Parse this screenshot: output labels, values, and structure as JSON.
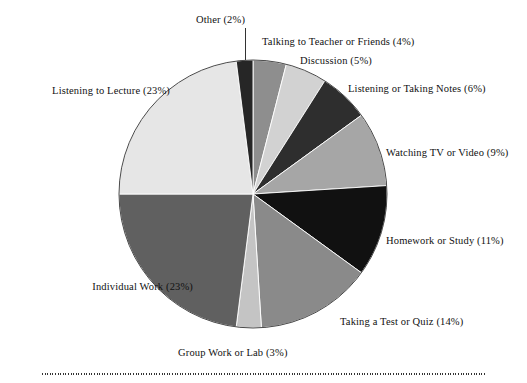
{
  "figure": {
    "title": "",
    "has_bottom_rule": true,
    "background": "#ffffff"
  },
  "chart_data": {
    "type": "pie",
    "title": "",
    "xlabel": "",
    "ylabel": "",
    "start_angle_deg": 0,
    "direction": "clockwise",
    "legend_position": "outside-labels",
    "grid": false,
    "categories": [
      "Talking to Teacher or Friends",
      "Discussion",
      "Listening or Taking Notes",
      "Watching TV or Video",
      "Homework or Study",
      "Taking a Test or Quiz",
      "Group Work or Lab",
      "Individual Work",
      "Listening to Lecture",
      "Other"
    ],
    "values": [
      4,
      5,
      6,
      9,
      11,
      14,
      3,
      23,
      23,
      2
    ],
    "unit": "%",
    "slices": [
      {
        "label": "Talking to Teacher or Friends",
        "value": 4,
        "percent_text": "4%",
        "label_text": "Talking to Teacher or Friends (4%)",
        "color": "#8e8e8e"
      },
      {
        "label": "Discussion",
        "value": 5,
        "percent_text": "5%",
        "label_text": "Discussion (5%)",
        "color": "#d2d2d2"
      },
      {
        "label": "Listening or Taking Notes",
        "value": 6,
        "percent_text": "6%",
        "label_text": "Listening or Taking Notes (6%)",
        "color": "#2e2e2e"
      },
      {
        "label": "Watching TV or Video",
        "value": 9,
        "percent_text": "9%",
        "label_text": "Watching TV or Video (9%)",
        "color": "#a6a6a6"
      },
      {
        "label": "Homework or Study",
        "value": 11,
        "percent_text": "11%",
        "label_text": "Homework or Study (11%)",
        "color": "#111111"
      },
      {
        "label": "Taking a Test or Quiz",
        "value": 14,
        "percent_text": "14%",
        "label_text": "Taking a Test or Quiz (14%)",
        "color": "#8a8a8a"
      },
      {
        "label": "Group Work or Lab",
        "value": 3,
        "percent_text": "3%",
        "label_text": "Group Work or Lab (3%)",
        "color": "#c4c4c4"
      },
      {
        "label": "Individual Work",
        "value": 23,
        "percent_text": "23%",
        "label_text": "Individual Work (23%)",
        "color": "#606060"
      },
      {
        "label": "Listening to Lecture",
        "value": 23,
        "percent_text": "23%",
        "label_text": "Listening to Lecture (23%)",
        "color": "#e6e6e6"
      },
      {
        "label": "Other",
        "value": 2,
        "percent_text": "2%",
        "label_text": "Other (2%)",
        "color": "#262626"
      }
    ]
  },
  "labels": {
    "other": "Other (2%)",
    "talking": "Talking to Teacher or Friends (4%)",
    "discussion": "Discussion (5%)",
    "listening_notes": "Listening or Taking Notes (6%)",
    "watching": "Watching TV or Video (9%)",
    "homework": "Homework or Study (11%)",
    "test": "Taking a Test or Quiz (14%)",
    "group": "Group Work or Lab (3%)",
    "individual": "Individual Work (23%)",
    "lecture": "Listening to Lecture (23%)"
  }
}
